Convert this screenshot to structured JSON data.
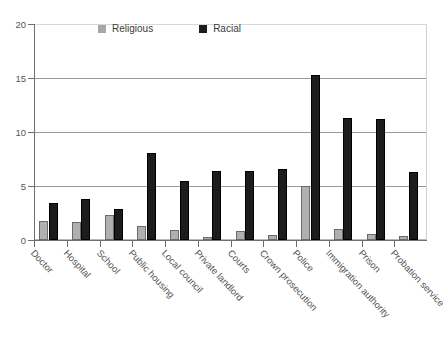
{
  "chart_data": {
    "type": "bar",
    "title": "",
    "subtitle": "",
    "xlabel": "",
    "ylabel": "",
    "ylim": [
      0,
      20
    ],
    "yticks": [
      0,
      5,
      10,
      15,
      20
    ],
    "grid": true,
    "grid_axis": "y",
    "legend_position": "top-center",
    "categories": [
      "Doctor",
      "Hospital",
      "School",
      "Public housing",
      "Local council",
      "Private landlord",
      "Courts",
      "Crown prosecution",
      "Police",
      "Immigration authority",
      "Prison",
      "Probation service"
    ],
    "series": [
      {
        "name": "Religious",
        "color": "#b0b0b0",
        "values": [
          1.8,
          1.7,
          2.3,
          1.3,
          0.9,
          0.3,
          0.8,
          0.5,
          5.0,
          1.0,
          0.6,
          0.4
        ]
      },
      {
        "name": "Racial",
        "color": "#1c1c1c",
        "values": [
          3.4,
          3.8,
          2.9,
          8.1,
          5.5,
          6.4,
          6.4,
          6.6,
          15.3,
          11.3,
          11.2,
          6.3
        ]
      }
    ]
  },
  "axis": {
    "y_tick_labels": [
      "0",
      "5",
      "10",
      "15",
      "20"
    ]
  },
  "legend": {
    "items": [
      {
        "label": "Religious",
        "swatch": "legend-swatch-religious"
      },
      {
        "label": "Racial",
        "swatch": "legend-swatch-racial"
      }
    ]
  }
}
